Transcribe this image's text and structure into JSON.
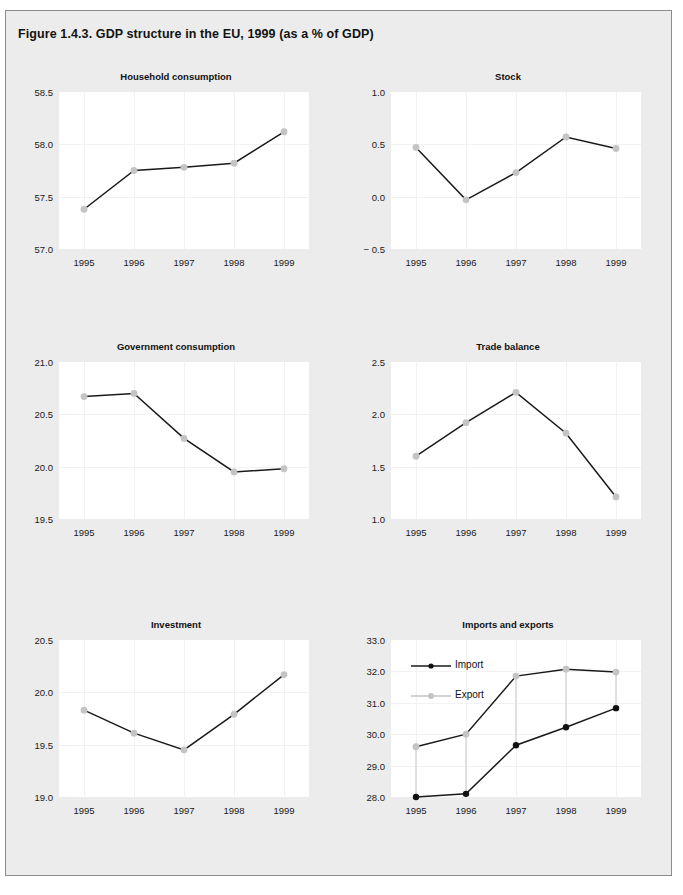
{
  "figure": {
    "title": "Figure 1.4.3. GDP structure in the EU, 1999 (as a % of GDP)",
    "background_color": "#ececec",
    "panel_color": "#ffffff",
    "grid_color": "#f2f2f2",
    "line_color": "#1a1a1a",
    "marker_gray": "#c4c4c4",
    "marker_black": "#111111",
    "connector_color": "#d9d9d9"
  },
  "chart_data": [
    {
      "type": "line",
      "title": "Household consumption",
      "xlabel": "",
      "ylabel": "",
      "categories": [
        "1995",
        "1996",
        "1997",
        "1998",
        "1999"
      ],
      "x": [
        1995,
        1996,
        1997,
        1998,
        1999
      ],
      "values": [
        57.38,
        57.75,
        57.78,
        57.82,
        58.12
      ],
      "ylim": [
        57.0,
        58.5
      ],
      "yticks": [
        57.0,
        57.5,
        58.0,
        58.5
      ],
      "ytick_labels": [
        "57.0",
        "57.5",
        "58.0",
        "58.5"
      ],
      "grid": true,
      "legend": null,
      "marker": "gray-circle"
    },
    {
      "type": "line",
      "title": "Stock",
      "xlabel": "",
      "ylabel": "",
      "categories": [
        "1995",
        "1996",
        "1997",
        "1998",
        "1999"
      ],
      "x": [
        1995,
        1996,
        1997,
        1998,
        1999
      ],
      "values": [
        0.47,
        -0.03,
        0.23,
        0.57,
        0.46
      ],
      "ylim": [
        -0.5,
        1.0
      ],
      "yticks": [
        -0.5,
        0.0,
        0.5,
        1.0
      ],
      "ytick_labels": [
        "− 0.5",
        "0.0",
        "0.5",
        "1.0"
      ],
      "grid": true,
      "legend": null,
      "marker": "gray-circle"
    },
    {
      "type": "line",
      "title": "Government consumption",
      "xlabel": "",
      "ylabel": "",
      "categories": [
        "1995",
        "1996",
        "1997",
        "1998",
        "1999"
      ],
      "x": [
        1995,
        1996,
        1997,
        1998,
        1999
      ],
      "values": [
        20.67,
        20.7,
        20.27,
        19.95,
        19.98
      ],
      "ylim": [
        19.5,
        21.0
      ],
      "yticks": [
        19.5,
        20.0,
        20.5,
        21.0
      ],
      "ytick_labels": [
        "19.5",
        "20.0",
        "20.5",
        "21.0"
      ],
      "grid": true,
      "legend": null,
      "marker": "gray-circle"
    },
    {
      "type": "line",
      "title": "Trade balance",
      "xlabel": "",
      "ylabel": "",
      "categories": [
        "1995",
        "1996",
        "1997",
        "1998",
        "1999"
      ],
      "x": [
        1995,
        1996,
        1997,
        1998,
        1999
      ],
      "values": [
        1.6,
        1.92,
        2.21,
        1.82,
        1.21
      ],
      "ylim": [
        1.0,
        2.5
      ],
      "yticks": [
        1.0,
        1.5,
        2.0,
        2.5
      ],
      "ytick_labels": [
        "1.0",
        "1.5",
        "2.0",
        "2.5"
      ],
      "grid": true,
      "legend": null,
      "marker": "gray-circle"
    },
    {
      "type": "line",
      "title": "Investment",
      "xlabel": "",
      "ylabel": "",
      "categories": [
        "1995",
        "1996",
        "1997",
        "1998",
        "1999"
      ],
      "x": [
        1995,
        1996,
        1997,
        1998,
        1999
      ],
      "values": [
        19.83,
        19.61,
        19.45,
        19.79,
        20.17
      ],
      "ylim": [
        19.0,
        20.5
      ],
      "yticks": [
        19.0,
        19.5,
        20.0,
        20.5
      ],
      "ytick_labels": [
        "19.0",
        "19.5",
        "20.0",
        "20.5"
      ],
      "grid": true,
      "legend": null,
      "marker": "gray-circle"
    },
    {
      "type": "line",
      "title": "Imports and exports",
      "xlabel": "",
      "ylabel": "",
      "categories": [
        "1995",
        "1996",
        "1997",
        "1998",
        "1999"
      ],
      "x": [
        1995,
        1996,
        1997,
        1998,
        1999
      ],
      "series": [
        {
          "name": "Import",
          "values": [
            28.0,
            28.1,
            29.65,
            30.22,
            30.83
          ],
          "marker": "black-circle"
        },
        {
          "name": "Export",
          "values": [
            29.6,
            30.0,
            31.85,
            32.07,
            31.98
          ],
          "marker": "gray-circle"
        }
      ],
      "ylim": [
        28.0,
        33.0
      ],
      "yticks": [
        28.0,
        29.0,
        30.0,
        31.0,
        32.0,
        33.0
      ],
      "ytick_labels": [
        "28.0",
        "29.0",
        "30.0",
        "31.0",
        "32.0",
        "33.0"
      ],
      "grid": true,
      "legend": {
        "position": "top-left",
        "entries": [
          "Import",
          "Export"
        ]
      },
      "connectors": true
    }
  ]
}
